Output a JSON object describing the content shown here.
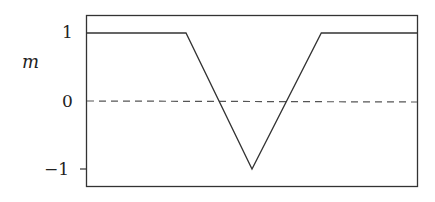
{
  "chart_data": {
    "type": "line",
    "title": "",
    "xlabel": "",
    "ylabel": "m",
    "ylim": [
      -1.2,
      1.25
    ],
    "xlim": [
      0,
      1
    ],
    "yticks": [
      1,
      0,
      -1
    ],
    "ytick_labels": [
      "1",
      "0",
      "−1"
    ],
    "grid": false,
    "legend": null,
    "series": [
      {
        "name": "m",
        "style": "solid",
        "x": [
          0,
          0.3,
          0.5,
          0.71,
          1.0
        ],
        "y": [
          1,
          1,
          -1,
          1,
          1
        ]
      },
      {
        "name": "zero reference",
        "style": "dashed",
        "x": [
          0,
          1
        ],
        "y": [
          0,
          0
        ]
      }
    ]
  },
  "labels": {
    "ylabel": "m",
    "tick_1": "1",
    "tick_0": "0",
    "tick_m1": "−1"
  }
}
